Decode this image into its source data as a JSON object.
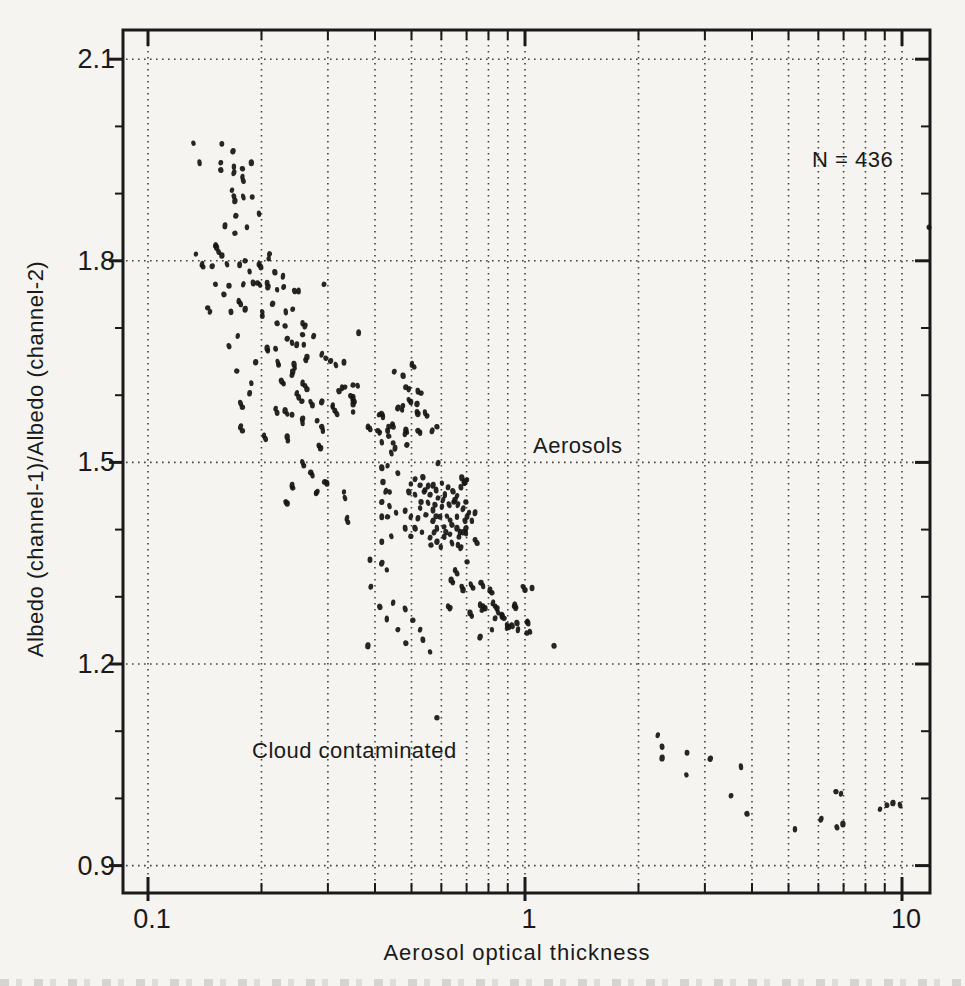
{
  "colors": {
    "ink": "#1a1a1a",
    "paper": "#f5f4f0",
    "point": "#161616",
    "grid_dot": "#2f2f2f"
  },
  "chart_data": {
    "type": "scatter",
    "title": "",
    "xlabel": "Aerosol optical thickness",
    "ylabel": "Albedo (channel-1)/Albedo (channel-2)",
    "x_scale": "log",
    "y_scale": "linear",
    "xlim": [
      0.085,
      11.9
    ],
    "ylim": [
      0.86,
      2.14
    ],
    "grid": {
      "style": "dotted",
      "horizontal_at": [
        2.1,
        1.8,
        1.5,
        1.2,
        0.9
      ],
      "vertical": "all_x_ticks"
    },
    "x_ticks": {
      "major": [
        {
          "label": "0.1",
          "value": 0.1
        },
        {
          "label": "1",
          "value": 1
        },
        {
          "label": "10",
          "value": 10
        }
      ],
      "minor_values": [
        0.2,
        0.3,
        0.4,
        0.5,
        0.6,
        0.7,
        0.8,
        0.9,
        2,
        3,
        4,
        5,
        6,
        7,
        8,
        9
      ]
    },
    "y_ticks": {
      "major": [
        {
          "label": "2.1",
          "value": 2.1
        },
        {
          "label": "1.8",
          "value": 1.8
        },
        {
          "label": "1.5",
          "value": 1.5
        },
        {
          "label": "1.2",
          "value": 1.2
        },
        {
          "label": "0.9",
          "value": 0.9
        }
      ],
      "minor_values": [
        1.0,
        1.1,
        1.3,
        1.4,
        1.6,
        1.7,
        1.9,
        2.0
      ]
    },
    "annotations": [
      {
        "text": "N = 436",
        "x": 7.3,
        "y": 1.95
      },
      {
        "text": "Aerosols",
        "x": 1.36,
        "y": 1.53
      },
      {
        "text": "Cloud contaminated",
        "x": 0.33,
        "y": 1.07
      }
    ],
    "n_points": 436,
    "points": [
      [
        0.132,
        1.975
      ],
      [
        0.157,
        1.974
      ],
      [
        0.168,
        1.963
      ],
      [
        0.137,
        1.946
      ],
      [
        0.156,
        1.946
      ],
      [
        0.156,
        1.935
      ],
      [
        0.169,
        1.94
      ],
      [
        0.169,
        1.931
      ],
      [
        0.178,
        1.937
      ],
      [
        0.178,
        1.925
      ],
      [
        0.179,
        1.919
      ],
      [
        0.188,
        1.946
      ],
      [
        0.167,
        1.905
      ],
      [
        0.169,
        1.896
      ],
      [
        0.17,
        1.889
      ],
      [
        0.179,
        1.895
      ],
      [
        0.189,
        1.895
      ],
      [
        0.171,
        1.867
      ],
      [
        0.197,
        1.87
      ],
      [
        0.16,
        1.852
      ],
      [
        0.17,
        1.841
      ],
      [
        0.183,
        1.85
      ],
      [
        0.151,
        1.823
      ],
      [
        0.152,
        1.82
      ],
      [
        0.134,
        1.81
      ],
      [
        0.154,
        1.813
      ],
      [
        0.157,
        1.808
      ],
      [
        0.139,
        1.795
      ],
      [
        0.14,
        1.791
      ],
      [
        0.148,
        1.792
      ],
      [
        0.162,
        1.795
      ],
      [
        0.175,
        1.794
      ],
      [
        0.181,
        1.8
      ],
      [
        0.186,
        1.784
      ],
      [
        0.197,
        1.795
      ],
      [
        0.199,
        1.791
      ],
      [
        0.209,
        1.803
      ],
      [
        0.21,
        1.81
      ],
      [
        0.217,
        1.783
      ],
      [
        0.228,
        1.777
      ],
      [
        0.151,
        1.765
      ],
      [
        0.164,
        1.763
      ],
      [
        0.179,
        1.765
      ],
      [
        0.19,
        1.767
      ],
      [
        0.195,
        1.767
      ],
      [
        0.198,
        1.764
      ],
      [
        0.207,
        1.767
      ],
      [
        0.208,
        1.761
      ],
      [
        0.22,
        1.757
      ],
      [
        0.229,
        1.761
      ],
      [
        0.245,
        1.755
      ],
      [
        0.251,
        1.755
      ],
      [
        0.293,
        1.765
      ],
      [
        0.159,
        1.75
      ],
      [
        0.174,
        1.74
      ],
      [
        0.176,
        1.736
      ],
      [
        0.144,
        1.73
      ],
      [
        0.146,
        1.724
      ],
      [
        0.166,
        1.724
      ],
      [
        0.181,
        1.728
      ],
      [
        0.201,
        1.724
      ],
      [
        0.201,
        1.718
      ],
      [
        0.214,
        1.736
      ],
      [
        0.232,
        1.724
      ],
      [
        0.242,
        1.728
      ],
      [
        0.22,
        1.707
      ],
      [
        0.257,
        1.707
      ],
      [
        0.261,
        1.703
      ],
      [
        0.231,
        1.703
      ],
      [
        0.173,
        1.688
      ],
      [
        0.164,
        1.673
      ],
      [
        0.207,
        1.67
      ],
      [
        0.208,
        1.666
      ],
      [
        0.218,
        1.669
      ],
      [
        0.193,
        1.649
      ],
      [
        0.221,
        1.649
      ],
      [
        0.222,
        1.645
      ],
      [
        0.234,
        1.684
      ],
      [
        0.241,
        1.678
      ],
      [
        0.248,
        1.675
      ],
      [
        0.257,
        1.69
      ],
      [
        0.259,
        1.675
      ],
      [
        0.275,
        1.688
      ],
      [
        0.244,
        1.646
      ],
      [
        0.245,
        1.64
      ],
      [
        0.262,
        1.652
      ],
      [
        0.264,
        1.657
      ],
      [
        0.289,
        1.661
      ],
      [
        0.296,
        1.655
      ],
      [
        0.305,
        1.651
      ],
      [
        0.315,
        1.645
      ],
      [
        0.331,
        1.649
      ],
      [
        0.172,
        1.636
      ],
      [
        0.188,
        1.618
      ],
      [
        0.186,
        1.603
      ],
      [
        0.226,
        1.621
      ],
      [
        0.229,
        1.617
      ],
      [
        0.241,
        1.63
      ],
      [
        0.242,
        1.635
      ],
      [
        0.257,
        1.618
      ],
      [
        0.261,
        1.614
      ],
      [
        0.264,
        1.609
      ],
      [
        0.248,
        1.603
      ],
      [
        0.251,
        1.597
      ],
      [
        0.256,
        1.591
      ],
      [
        0.27,
        1.59
      ],
      [
        0.273,
        1.585
      ],
      [
        0.289,
        1.59
      ],
      [
        0.309,
        1.582
      ],
      [
        0.313,
        1.577
      ],
      [
        0.321,
        1.606
      ],
      [
        0.327,
        1.611
      ],
      [
        0.333,
        1.612
      ],
      [
        0.345,
        1.599
      ],
      [
        0.349,
        1.594
      ],
      [
        0.176,
        1.588
      ],
      [
        0.178,
        1.582
      ],
      [
        0.218,
        1.58
      ],
      [
        0.22,
        1.574
      ],
      [
        0.231,
        1.577
      ],
      [
        0.234,
        1.572
      ],
      [
        0.241,
        1.571
      ],
      [
        0.257,
        1.565
      ],
      [
        0.257,
        1.559
      ],
      [
        0.281,
        1.562
      ],
      [
        0.289,
        1.553
      ],
      [
        0.291,
        1.547
      ],
      [
        0.176,
        1.553
      ],
      [
        0.178,
        1.547
      ],
      [
        0.203,
        1.54
      ],
      [
        0.205,
        1.535
      ],
      [
        0.234,
        1.538
      ],
      [
        0.235,
        1.532
      ],
      [
        0.284,
        1.525
      ],
      [
        0.287,
        1.521
      ],
      [
        0.257,
        1.5
      ],
      [
        0.259,
        1.495
      ],
      [
        0.27,
        1.485
      ],
      [
        0.273,
        1.481
      ],
      [
        0.241,
        1.466
      ],
      [
        0.242,
        1.462
      ],
      [
        0.279,
        1.454
      ],
      [
        0.281,
        1.456
      ],
      [
        0.298,
        1.469
      ],
      [
        0.331,
        1.456
      ],
      [
        0.232,
        1.441
      ],
      [
        0.234,
        1.439
      ],
      [
        0.337,
        1.417
      ],
      [
        0.339,
        1.411
      ],
      [
        0.294,
        1.471
      ],
      [
        0.333,
        1.447
      ],
      [
        0.362,
        1.693
      ],
      [
        0.35,
        1.615
      ],
      [
        0.36,
        1.614
      ],
      [
        0.35,
        1.597
      ],
      [
        0.352,
        1.591
      ],
      [
        0.35,
        1.575
      ],
      [
        0.45,
        1.635
      ],
      [
        0.475,
        1.629
      ],
      [
        0.501,
        1.646
      ],
      [
        0.508,
        1.642
      ],
      [
        0.483,
        1.612
      ],
      [
        0.492,
        1.609
      ],
      [
        0.52,
        1.606
      ],
      [
        0.53,
        1.603
      ],
      [
        0.492,
        1.593
      ],
      [
        0.498,
        1.59
      ],
      [
        0.46,
        1.581
      ],
      [
        0.472,
        1.578
      ],
      [
        0.474,
        1.584
      ],
      [
        0.417,
        1.572
      ],
      [
        0.42,
        1.568
      ],
      [
        0.445,
        1.557
      ],
      [
        0.447,
        1.553
      ],
      [
        0.383,
        1.553
      ],
      [
        0.388,
        1.55
      ],
      [
        0.407,
        1.547
      ],
      [
        0.412,
        1.544
      ],
      [
        0.432,
        1.547
      ],
      [
        0.483,
        1.548
      ],
      [
        0.486,
        1.545
      ],
      [
        0.517,
        1.575
      ],
      [
        0.52,
        1.572
      ],
      [
        0.543,
        1.574
      ],
      [
        0.55,
        1.569
      ],
      [
        0.52,
        1.547
      ],
      [
        0.527,
        1.544
      ],
      [
        0.567,
        1.547
      ],
      [
        0.584,
        1.553
      ],
      [
        0.309,
        1.585
      ],
      [
        0.317,
        1.572
      ],
      [
        0.35,
        1.587
      ],
      [
        0.41,
        1.571
      ],
      [
        0.435,
        1.553
      ],
      [
        0.517,
        1.587
      ],
      [
        0.442,
        1.514
      ],
      [
        0.447,
        1.529
      ],
      [
        0.486,
        1.526
      ],
      [
        0.417,
        1.53
      ],
      [
        0.452,
        1.521
      ],
      [
        0.435,
        1.539
      ],
      [
        0.48,
        1.542
      ],
      [
        0.588,
        1.499
      ],
      [
        0.417,
        1.492
      ],
      [
        0.432,
        1.495
      ],
      [
        0.46,
        1.484
      ],
      [
        0.42,
        1.471
      ],
      [
        0.427,
        1.457
      ],
      [
        0.437,
        1.456
      ],
      [
        0.417,
        1.441
      ],
      [
        0.437,
        1.435
      ],
      [
        0.417,
        1.419
      ],
      [
        0.432,
        1.419
      ],
      [
        0.455,
        1.425
      ],
      [
        0.481,
        1.428
      ],
      [
        0.492,
        1.456
      ],
      [
        0.498,
        1.468
      ],
      [
        0.511,
        1.475
      ],
      [
        0.536,
        1.478
      ],
      [
        0.553,
        1.465
      ],
      [
        0.54,
        1.456
      ],
      [
        0.53,
        1.441
      ],
      [
        0.498,
        1.419
      ],
      [
        0.481,
        1.402
      ],
      [
        0.498,
        1.39
      ],
      [
        0.442,
        1.39
      ],
      [
        0.417,
        1.382
      ],
      [
        0.57,
        1.466
      ],
      [
        0.602,
        1.469
      ],
      [
        0.625,
        1.463
      ],
      [
        0.644,
        1.457
      ],
      [
        0.613,
        1.452
      ],
      [
        0.588,
        1.447
      ],
      [
        0.577,
        1.437
      ],
      [
        0.602,
        1.434
      ],
      [
        0.629,
        1.437
      ],
      [
        0.648,
        1.441
      ],
      [
        0.66,
        1.45
      ],
      [
        0.676,
        1.463
      ],
      [
        0.693,
        1.471
      ],
      [
        0.621,
        1.42
      ],
      [
        0.595,
        1.419
      ],
      [
        0.57,
        1.413
      ],
      [
        0.584,
        1.402
      ],
      [
        0.61,
        1.404
      ],
      [
        0.64,
        1.407
      ],
      [
        0.66,
        1.419
      ],
      [
        0.685,
        1.431
      ],
      [
        0.697,
        1.441
      ],
      [
        0.71,
        1.425
      ],
      [
        0.693,
        1.413
      ],
      [
        0.66,
        1.402
      ],
      [
        0.633,
        1.393
      ],
      [
        0.61,
        1.389
      ],
      [
        0.584,
        1.382
      ],
      [
        0.64,
        1.38
      ],
      [
        0.668,
        1.389
      ],
      [
        0.697,
        1.402
      ],
      [
        0.723,
        1.413
      ],
      [
        0.737,
        1.425
      ],
      [
        0.563,
        1.377
      ],
      [
        0.598,
        1.374
      ],
      [
        0.574,
        1.396
      ],
      [
        0.68,
        1.477
      ],
      [
        0.702,
        1.474
      ],
      [
        0.689,
        1.469
      ],
      [
        0.652,
        1.444
      ],
      [
        0.664,
        1.437
      ],
      [
        0.543,
        1.459
      ],
      [
        0.56,
        1.452
      ],
      [
        0.553,
        1.44
      ],
      [
        0.57,
        1.429
      ],
      [
        0.546,
        1.422
      ],
      [
        0.527,
        1.432
      ],
      [
        0.52,
        1.417
      ],
      [
        0.511,
        1.402
      ],
      [
        0.533,
        1.396
      ],
      [
        0.56,
        1.388
      ],
      [
        0.617,
        1.396
      ],
      [
        0.672,
        1.396
      ],
      [
        0.633,
        1.414
      ],
      [
        0.581,
        1.42
      ],
      [
        0.606,
        1.444
      ],
      [
        0.581,
        1.459
      ],
      [
        0.527,
        1.466
      ],
      [
        0.511,
        1.452
      ],
      [
        0.388,
        1.355
      ],
      [
        0.417,
        1.35
      ],
      [
        0.43,
        1.34
      ],
      [
        0.39,
        1.315
      ],
      [
        0.412,
        1.285
      ],
      [
        0.43,
        1.267
      ],
      [
        0.46,
        1.251
      ],
      [
        0.483,
        1.231
      ],
      [
        0.447,
        1.291
      ],
      [
        0.481,
        1.282
      ],
      [
        0.504,
        1.265
      ],
      [
        0.527,
        1.251
      ],
      [
        0.536,
        1.236
      ],
      [
        0.383,
        1.227
      ],
      [
        0.56,
        1.218
      ],
      [
        0.702,
        1.419
      ],
      [
        0.685,
        1.396
      ],
      [
        0.697,
        1.395
      ],
      [
        0.737,
        1.385
      ],
      [
        0.746,
        1.38
      ],
      [
        0.664,
        1.377
      ],
      [
        0.676,
        1.373
      ],
      [
        0.702,
        1.352
      ],
      [
        0.652,
        1.34
      ],
      [
        0.66,
        1.335
      ],
      [
        0.637,
        1.325
      ],
      [
        0.644,
        1.321
      ],
      [
        0.68,
        1.315
      ],
      [
        0.685,
        1.31
      ],
      [
        0.719,
        1.318
      ],
      [
        0.728,
        1.313
      ],
      [
        0.764,
        1.321
      ],
      [
        0.774,
        1.316
      ],
      [
        0.807,
        1.31
      ],
      [
        0.817,
        1.306
      ],
      [
        0.625,
        1.286
      ],
      [
        0.633,
        1.283
      ],
      [
        0.715,
        1.276
      ],
      [
        0.723,
        1.271
      ],
      [
        0.774,
        1.286
      ],
      [
        0.783,
        1.283
      ],
      [
        0.822,
        1.291
      ],
      [
        0.833,
        1.286
      ],
      [
        0.843,
        1.283
      ],
      [
        0.848,
        1.277
      ],
      [
        0.869,
        1.271
      ],
      [
        0.88,
        1.268
      ],
      [
        0.896,
        1.258
      ],
      [
        0.907,
        1.255
      ],
      [
        0.924,
        1.257
      ],
      [
        0.935,
        1.286
      ],
      [
        0.946,
        1.283
      ],
      [
        0.952,
        1.261
      ],
      [
        0.958,
        1.251
      ],
      [
        0.988,
        1.315
      ],
      [
        1.0,
        1.31
      ],
      [
        1.012,
        1.263
      ],
      [
        1.019,
        1.261
      ],
      [
        1.012,
        1.246
      ],
      [
        1.031,
        1.248
      ],
      [
        1.044,
        1.313
      ],
      [
        0.76,
        1.24
      ],
      [
        0.817,
        1.251
      ],
      [
        0.833,
        1.268
      ],
      [
        0.869,
        1.273
      ],
      [
        0.76,
        1.288
      ],
      [
        0.769,
        1.28
      ],
      [
        1.194,
        1.227
      ],
      [
        0.896,
        1.254
      ],
      [
        0.941,
        1.288
      ],
      [
        0.584,
        1.12
      ],
      [
        2.25,
        1.094
      ],
      [
        2.31,
        1.077
      ],
      [
        2.31,
        1.06
      ],
      [
        2.68,
        1.035
      ],
      [
        2.69,
        1.068
      ],
      [
        3.1,
        1.059
      ],
      [
        3.74,
        1.047
      ],
      [
        3.52,
        1.004
      ],
      [
        3.88,
        0.977
      ],
      [
        5.2,
        0.954
      ],
      [
        6.1,
        0.969
      ],
      [
        6.68,
        1.01
      ],
      [
        6.89,
        1.007
      ],
      [
        6.72,
        0.957
      ],
      [
        6.97,
        0.962
      ],
      [
        8.74,
        0.984
      ],
      [
        9.12,
        0.99
      ],
      [
        9.46,
        0.993
      ],
      [
        9.88,
        0.99
      ],
      [
        11.9,
        1.85
      ]
    ]
  }
}
